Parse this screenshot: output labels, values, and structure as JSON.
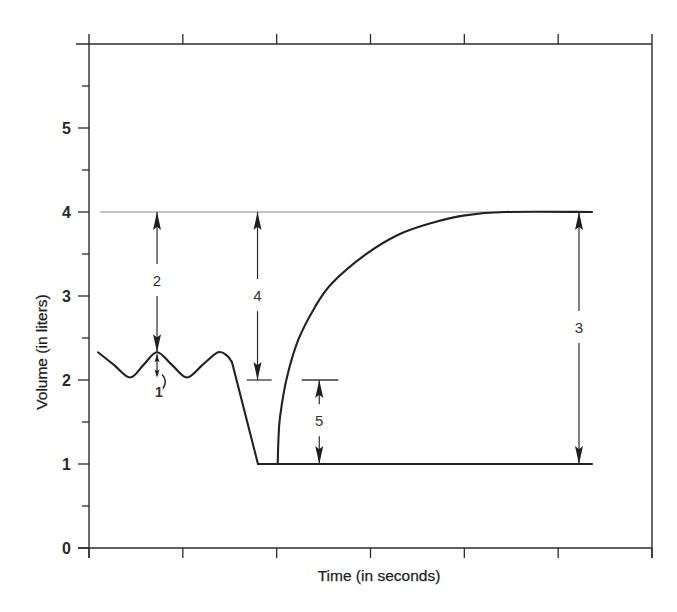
{
  "chart_data": {
    "type": "line",
    "title": "",
    "xlabel": "Time (in seconds)",
    "ylabel": "Volume (in liters)",
    "xlim": [
      0,
      6
    ],
    "ylim": [
      0,
      6
    ],
    "x_ticks": [
      0,
      1,
      2,
      3,
      4,
      5,
      6
    ],
    "x_tick_labels": [],
    "y_ticks": [
      0,
      1,
      2,
      3,
      4,
      5
    ],
    "y_tick_labels": [
      "0",
      "1",
      "2",
      "3",
      "4",
      "5"
    ],
    "y_minor_ticks": [
      0.5,
      1.5,
      2.5,
      3.5,
      4.5,
      5.5
    ],
    "grid": false,
    "legend": "none",
    "series": [
      {
        "name": "tidal-breathing",
        "smooth": true,
        "points": [
          [
            0.096,
            2.33
          ],
          [
            0.266,
            2.18
          ],
          [
            0.437,
            2.03
          ],
          [
            0.581,
            2.18
          ],
          [
            0.725,
            2.33
          ],
          [
            0.884,
            2.18
          ],
          [
            1.044,
            2.03
          ],
          [
            1.21,
            2.18
          ],
          [
            1.375,
            2.33
          ],
          [
            1.471,
            2.29
          ],
          [
            1.524,
            2.21
          ]
        ]
      },
      {
        "name": "forced-expiration",
        "smooth": false,
        "points": [
          [
            1.524,
            2.21
          ],
          [
            1.801,
            1.0
          ]
        ]
      },
      {
        "name": "residual-volume-baseline",
        "smooth": false,
        "points": [
          [
            1.801,
            1.0
          ],
          [
            5.361,
            1.0
          ]
        ]
      },
      {
        "name": "maximal-inspiration",
        "smooth": true,
        "points": [
          [
            2.011,
            1.0
          ],
          [
            2.019,
            1.29
          ],
          [
            2.036,
            1.56
          ],
          [
            2.107,
            2.02
          ],
          [
            2.231,
            2.48
          ],
          [
            2.409,
            2.87
          ],
          [
            2.587,
            3.15
          ],
          [
            2.942,
            3.49
          ],
          [
            3.296,
            3.73
          ],
          [
            3.652,
            3.87
          ],
          [
            4.007,
            3.96
          ],
          [
            4.434,
            4.0
          ],
          [
            5.361,
            4.0
          ]
        ]
      }
    ],
    "reference_lines": [
      {
        "name": "level-4-reference-line",
        "y": 4.0,
        "x_from": 0.117,
        "x_to": 4.466,
        "style": "thin"
      },
      {
        "name": "level-2-marker-left",
        "y": 2.0,
        "x_from": 1.681,
        "x_to": 1.947,
        "style": "normal"
      },
      {
        "name": "level-2-marker-right",
        "y": 2.0,
        "x_from": 2.267,
        "x_to": 2.657,
        "style": "normal"
      }
    ],
    "annotations": [
      {
        "label": "1",
        "x": 0.725,
        "y_from": 2.33,
        "y_to": 2.03,
        "label_x": 0.746,
        "label_y": 1.86,
        "kind": "small"
      },
      {
        "label": "2",
        "x": 0.725,
        "y_from": 4.0,
        "y_to": 2.33,
        "label_x": 0.725,
        "label_y": 3.19,
        "kind": "dimension"
      },
      {
        "label": "4",
        "x": 1.796,
        "y_from": 4.0,
        "y_to": 2.0,
        "label_x": 1.796,
        "label_y": 3.01,
        "kind": "dimension"
      },
      {
        "label": "3",
        "x": 5.222,
        "y_from": 4.0,
        "y_to": 1.0,
        "label_x": 5.222,
        "label_y": 2.63,
        "kind": "dimension"
      },
      {
        "label": "5",
        "x": 2.454,
        "y_from": 2.0,
        "y_to": 1.0,
        "label_x": 2.454,
        "label_y": 1.52,
        "kind": "dimension"
      }
    ]
  }
}
